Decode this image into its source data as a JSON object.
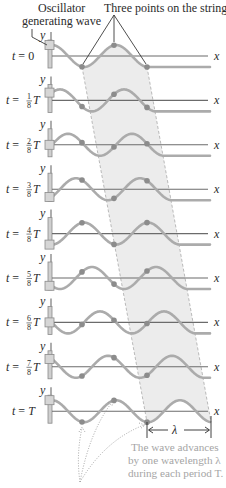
{
  "labels": {
    "oscillator_line1": "Oscillator",
    "oscillator_line2": "generating wave",
    "three_points": "Three points on the string",
    "axis_x": "x",
    "axis_y": "y",
    "lambda": "λ",
    "note_line1": "The wave advances",
    "note_line2": "by one wavelength λ",
    "note_line3": "during each period T."
  },
  "rows": [
    {
      "prefix": "t = 0",
      "num": "",
      "den": "",
      "suffix": "",
      "n": 0
    },
    {
      "prefix": "t = ",
      "num": "1",
      "den": "8",
      "suffix": "T",
      "n": 1
    },
    {
      "prefix": "t = ",
      "num": "2",
      "den": "8",
      "suffix": "T",
      "n": 2
    },
    {
      "prefix": "t = ",
      "num": "3",
      "den": "8",
      "suffix": "T",
      "n": 3
    },
    {
      "prefix": "t = ",
      "num": "4",
      "den": "8",
      "suffix": "T",
      "n": 4
    },
    {
      "prefix": "t = ",
      "num": "5",
      "den": "8",
      "suffix": "T",
      "n": 5
    },
    {
      "prefix": "t = ",
      "num": "6",
      "den": "8",
      "suffix": "T",
      "n": 6
    },
    {
      "prefix": "t = ",
      "num": "7",
      "den": "8",
      "suffix": "T",
      "n": 7
    },
    {
      "prefix": "t = T",
      "num": "",
      "den": "",
      "suffix": "",
      "n": 8
    }
  ],
  "geometry": {
    "first_axis_y": 56,
    "row_spacing": 44.4,
    "osc_x": 52,
    "axis_end_x": 208,
    "wavelength": 64,
    "amplitude": 11,
    "front_x0": 147,
    "points_x": [
      82,
      114,
      147
    ]
  },
  "colors": {
    "wave": "#ababab",
    "axis": "#6b6b6b",
    "band": "#ececec",
    "dot": "#8c8c8c",
    "note": "#a5a5a5"
  }
}
